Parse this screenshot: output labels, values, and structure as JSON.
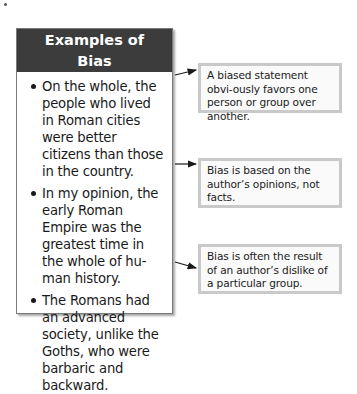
{
  "header": {
    "title_line1": "Examples of",
    "title_line2": "Bias"
  },
  "examples": [
    "On the whole, the people who lived in Roman cities were better citizens than those in the country.",
    "In my opinion, the early Roman Empire was the greatest time in the whole of hu-man history.",
    "The Romans had an advanced society, unlike the Goths, who were barbaric and backward."
  ],
  "callouts": [
    "A biased statement obvi-ously favors one person or group over another.",
    "Bias is based on the author’s opinions, not facts.",
    "Bias is often the result of an author’s dislike of a particular group."
  ],
  "colors": {
    "header_bg": "#3c3c3c",
    "callout_border": "#c9c9c9",
    "arrow": "#1a1a1a"
  }
}
